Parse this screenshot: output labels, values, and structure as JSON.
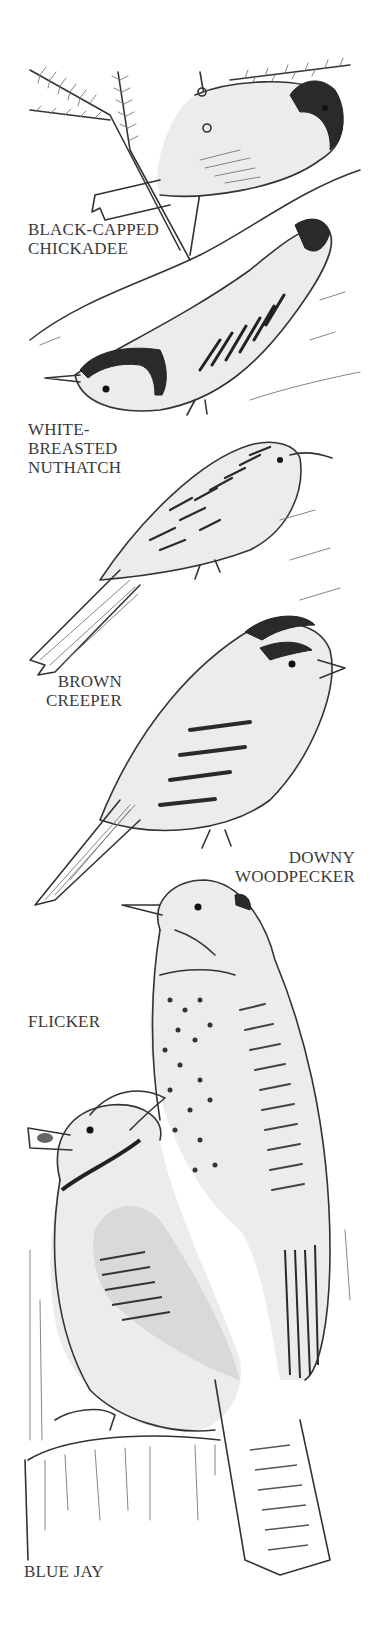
{
  "colors": {
    "ink": "#333333",
    "label": "#3a3a3a",
    "background": "#ffffff"
  },
  "birds": [
    {
      "id": "chickadee",
      "label_lines": [
        "BLACK-CAPPED",
        "CHICKADEE"
      ]
    },
    {
      "id": "nuthatch",
      "label_lines": [
        "WHITE-",
        "BREASTED",
        "NUTHATCH"
      ]
    },
    {
      "id": "creeper",
      "label_lines": [
        "BROWN",
        "CREEPER"
      ]
    },
    {
      "id": "downy",
      "label_lines": [
        "DOWNY",
        "WOODPECKER"
      ]
    },
    {
      "id": "flicker",
      "label_lines": [
        "FLICKER"
      ]
    },
    {
      "id": "bluejay",
      "label_lines": [
        "BLUE JAY"
      ]
    }
  ]
}
